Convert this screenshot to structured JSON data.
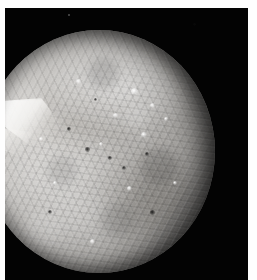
{
  "image": {
    "subject": "Miranda",
    "alt_text": "Grayscale spacecraft photograph of the Uranian moon Miranda, its cratered and grooved surface lit from the left with the right limb falling into shadow",
    "background_color": "#ffffff",
    "plate_color": "#030303",
    "body_highlight_color": "#d7d5d2",
    "body_shadow_color": "#070706"
  },
  "scene": {
    "body_name": "Miranda",
    "illumination": "lit from upper-left, terminator on the right limb",
    "features": [
      {
        "name": "bright-chevron-scarp",
        "tone": "bright",
        "position": "western limb, upper-left quadrant"
      },
      {
        "name": "northern-coronae",
        "tone": "bright",
        "position": "upper-right"
      },
      {
        "name": "dark-banded-terrain",
        "tone": "dark",
        "position": "mid-latitude band"
      },
      {
        "name": "ridged-southern-terrain",
        "tone": "mid",
        "position": "lower half"
      },
      {
        "name": "terminator-shadow",
        "tone": "black",
        "position": "right limb"
      }
    ],
    "bright_spots": [
      {
        "x": "64%",
        "y": "24%",
        "size": "7px"
      },
      {
        "x": "72%",
        "y": "30%",
        "size": "5px"
      },
      {
        "x": "56%",
        "y": "34%",
        "size": "5px"
      },
      {
        "x": "68%",
        "y": "42%",
        "size": "6px"
      },
      {
        "x": "78%",
        "y": "36%",
        "size": "4px"
      },
      {
        "x": "50%",
        "y": "46%",
        "size": "4px"
      },
      {
        "x": "40%",
        "y": "20%",
        "size": "5px"
      },
      {
        "x": "30%",
        "y": "62%",
        "size": "4px"
      },
      {
        "x": "62%",
        "y": "64%",
        "size": "5px"
      },
      {
        "x": "46%",
        "y": "86%",
        "size": "5px"
      },
      {
        "x": "82%",
        "y": "62%",
        "size": "4px"
      },
      {
        "x": "24%",
        "y": "44%",
        "size": "4px"
      }
    ],
    "dark_spots": [
      {
        "x": "44%",
        "y": "48%",
        "size": "5px"
      },
      {
        "x": "54%",
        "y": "52%",
        "size": "4px"
      },
      {
        "x": "36%",
        "y": "40%",
        "size": "4px"
      },
      {
        "x": "60%",
        "y": "56%",
        "size": "4px"
      },
      {
        "x": "70%",
        "y": "50%",
        "size": "4px"
      },
      {
        "x": "48%",
        "y": "28%",
        "size": "3px"
      },
      {
        "x": "28%",
        "y": "74%",
        "size": "4px"
      },
      {
        "x": "72%",
        "y": "74%",
        "size": "5px"
      }
    ],
    "sky_speck": {
      "x": "63px",
      "y": "6px"
    }
  }
}
